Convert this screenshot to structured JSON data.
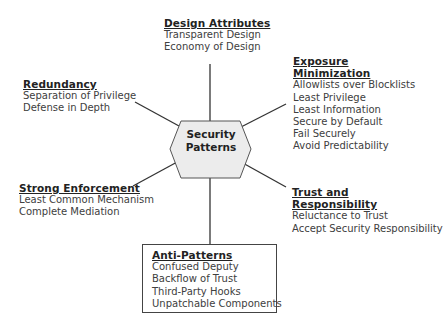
{
  "center": {
    "label_line1": "Security",
    "label_line2": "Patterns",
    "fill": "#ececec",
    "stroke": "#555555"
  },
  "groups": {
    "design_attributes": {
      "title": "Design Attributes",
      "items": [
        "Transparent Design",
        "Economy of Design"
      ]
    },
    "exposure_minimization": {
      "title_line1": "Exposure",
      "title_line2": "Minimization",
      "items": [
        "Allowlists over Blocklists",
        "Least Privilege",
        "Least Information",
        "Secure by Default",
        "Fail Securely",
        "Avoid Predictability"
      ]
    },
    "redundancy": {
      "title": "Redundancy",
      "items": [
        "Separation of Privilege",
        "Defense in Depth"
      ]
    },
    "strong_enforcement": {
      "title": "Strong Enforcement",
      "items": [
        "Least Common Mechanism",
        "Complete Mediation"
      ]
    },
    "trust_responsibility": {
      "title_line1": "Trust and",
      "title_line2": "Responsibility",
      "items": [
        "Reluctance to Trust",
        "Accept Security Responsibility"
      ]
    },
    "anti_patterns": {
      "title": "Anti-Patterns",
      "items": [
        "Confused Deputy",
        "Backflow of Trust",
        "Third-Party Hooks",
        "Unpatchable Components"
      ]
    }
  }
}
